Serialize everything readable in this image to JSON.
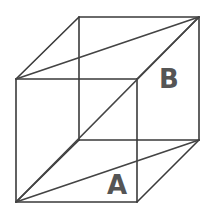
{
  "diagram": {
    "type": "wireframe-cube",
    "colors": {
      "edge": "#3a3a3a",
      "diagonal": "#444444",
      "label": "#555555",
      "background": "#ffffff"
    },
    "vertices": {
      "front_top_left": [
        16,
        79
      ],
      "front_top_right": [
        137,
        79
      ],
      "front_bottom_left": [
        16,
        202
      ],
      "front_bottom_right": [
        137,
        202
      ],
      "back_top_left": [
        79,
        17
      ],
      "back_top_right": [
        199,
        17
      ],
      "back_bottom_left": [
        79,
        140
      ],
      "back_bottom_right": [
        199,
        140
      ]
    },
    "labels": [
      {
        "id": "A",
        "text": "A",
        "x": 107,
        "y": 172
      },
      {
        "id": "B",
        "text": "B",
        "x": 159,
        "y": 66
      }
    ],
    "diagonals": [
      {
        "name": "space-diagonal",
        "from": "front_bottom_left",
        "to": "back_top_right"
      },
      {
        "name": "top-face-diagonal",
        "from": "front_top_left",
        "to": "back_top_right"
      },
      {
        "name": "bottom-face-diagonal",
        "from": "front_bottom_left",
        "to": "back_bottom_right"
      }
    ]
  }
}
